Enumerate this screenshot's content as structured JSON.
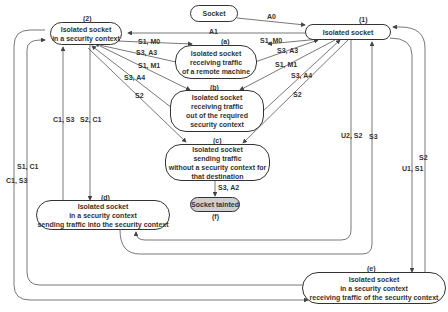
{
  "nodes": {
    "socket": {
      "id": "",
      "text": "Socket"
    },
    "n1": {
      "id": "(1)",
      "text": "Isolated socket"
    },
    "n2": {
      "id": "(2)",
      "text": "Isolated socket\nin a security context"
    },
    "na": {
      "id": "(a)",
      "text": "Isolated socket\nreceiving  traffic\nof a remote machine"
    },
    "nb": {
      "id": "(b)",
      "text": "Isolated socket\nreceiving traffic\nout of the required\nsecurity context"
    },
    "nc": {
      "id": "(c)",
      "text": "Isolated socket\nsending traffic\nwithout a security context for\nthat destination"
    },
    "nd": {
      "id": "(d)",
      "text": "Isolated socket\nin a security context\nsending traffic into the security context"
    },
    "ne": {
      "id": "(e)",
      "text": "Isolated socket\nin a security context\nreceiving traffic of the security context"
    },
    "nf": {
      "id": "(f)",
      "text": "Socket tainted"
    }
  },
  "edges": {
    "a0": "A0",
    "a1": "A1",
    "s1m0_left": "S1, M0",
    "s3a3_left": "S3, A3",
    "s1m1_left": "S1, M1",
    "s3a4_left": "S3, A4",
    "s2_left": "S2",
    "s1m0_right": "S1, M0",
    "s3a3_right": "S3, A3",
    "s1m1_right": "S1, M1",
    "s3a4_right": "S3, A4",
    "s2_right": "S2",
    "c1s3_d": "C1, S3",
    "s2c1_d": "S2, C1",
    "s1c1": "S1, C1",
    "c1s3_outer": "C1, S3",
    "u2s2": "U2, S2",
    "s3_right": "S3",
    "s2_outer": "S2",
    "u1s1": "U1, S1",
    "s3a2": "S3, A2"
  }
}
